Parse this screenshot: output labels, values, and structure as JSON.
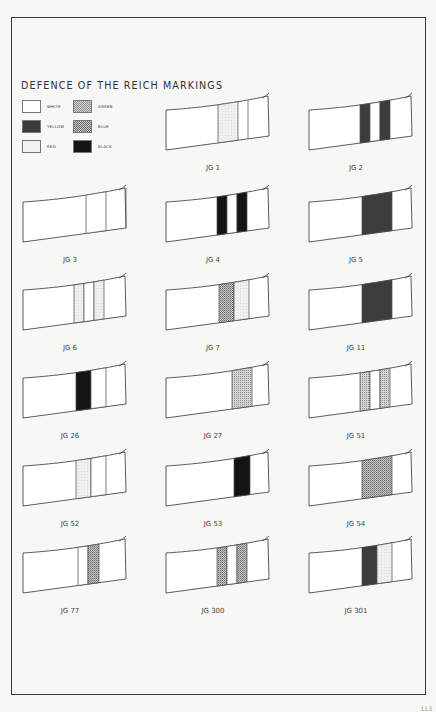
{
  "title": "DEFENCE OF THE REICH MARKINGS",
  "legend": [
    {
      "key": "white",
      "label": "WHITE"
    },
    {
      "key": "yellow",
      "label": "YELLOW"
    },
    {
      "key": "red",
      "label": "RED"
    },
    {
      "key": "green",
      "label": "GREEN"
    },
    {
      "key": "blue",
      "label": "BLUE"
    },
    {
      "key": "black",
      "label": "BLACK"
    }
  ],
  "colors": {
    "white": "#ffffff",
    "yellow": "#3c3c3c",
    "red": "#f1f1ef",
    "green": "#bdbdbd",
    "blue": "#a9a9a9",
    "black": "#141414",
    "outline": "#4a4a4a",
    "paper": "#f7f7f5"
  },
  "units": [
    {
      "name": "JG 1",
      "bands": [
        "red"
      ]
    },
    {
      "name": "JG 2",
      "bands": [
        "yellow",
        "white",
        "yellow"
      ]
    },
    {
      "name": "JG 3",
      "bands": [
        "white"
      ]
    },
    {
      "name": "JG 4",
      "bands": [
        "black",
        "white",
        "black"
      ]
    },
    {
      "name": "JG 5",
      "bands": [
        "yellow"
      ]
    },
    {
      "name": "JG 6",
      "bands": [
        "red",
        "white",
        "red"
      ]
    },
    {
      "name": "JG 7",
      "bands": [
        "blue",
        "red"
      ]
    },
    {
      "name": "JG 11",
      "bands": [
        "yellow"
      ]
    },
    {
      "name": "JG 26",
      "bands": [
        "black",
        "white"
      ]
    },
    {
      "name": "JG 27",
      "bands": [
        "green"
      ]
    },
    {
      "name": "JG 51",
      "bands": [
        "green",
        "white",
        "green"
      ]
    },
    {
      "name": "JG 52",
      "bands": [
        "red",
        "white"
      ]
    },
    {
      "name": "JG 53",
      "bands": [
        "black"
      ]
    },
    {
      "name": "JG 54",
      "bands": [
        "blue"
      ]
    },
    {
      "name": "JG 77",
      "bands": [
        "white",
        "blue"
      ]
    },
    {
      "name": "JG 300",
      "bands": [
        "blue",
        "white",
        "blue"
      ]
    },
    {
      "name": "JG 301",
      "bands": [
        "yellow",
        "red"
      ]
    }
  ],
  "page_number": "113"
}
